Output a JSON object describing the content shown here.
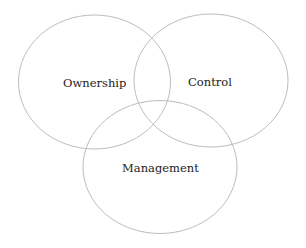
{
  "diagram": {
    "type": "venn",
    "stroke_color": "#bdbdbd",
    "text_color": "#222222",
    "sets": [
      {
        "label": "Ownership"
      },
      {
        "label": "Control"
      },
      {
        "label": "Management"
      }
    ]
  }
}
